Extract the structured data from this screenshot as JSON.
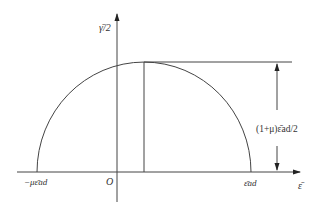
{
  "diagram": {
    "type": "mohr-circle-strain",
    "y_axis_label": "γ̄/2",
    "x_axis_label": "ε̄",
    "origin_label": "O",
    "left_intercept_label": "−με̄ad",
    "right_intercept_label": "ε̄ad",
    "dimension_label": "(1+μ)ε̄ad/2",
    "colors": {
      "stroke": "#333333",
      "background": "#ffffff"
    }
  }
}
